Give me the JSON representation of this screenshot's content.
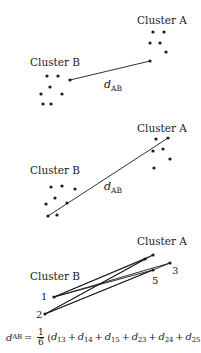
{
  "panels": [
    {
      "id": "single-linkage",
      "cluster_a_label": "Cluster A",
      "cluster_b_label": "Cluster B",
      "distance_label": "d",
      "distance_subscript": "AB",
      "cluster_a_points": [
        [
          153,
          32
        ],
        [
          164,
          32
        ],
        [
          150,
          43
        ],
        [
          160,
          43
        ],
        [
          166,
          52
        ],
        [
          150,
          61
        ]
      ],
      "cluster_b_points": [
        [
          47,
          76
        ],
        [
          58,
          76
        ],
        [
          70,
          80
        ],
        [
          50,
          87
        ],
        [
          41,
          94
        ],
        [
          62,
          94
        ],
        [
          43,
          104
        ],
        [
          51,
          104
        ]
      ],
      "links": [
        [
          [
            70,
            80
          ],
          [
            150,
            61
          ]
        ]
      ]
    },
    {
      "id": "complete-linkage",
      "cluster_a_label": "Cluster A",
      "cluster_b_label": "Cluster B",
      "distance_label": "d",
      "distance_subscript": "AB",
      "cluster_a_points": [
        [
          156,
          139
        ],
        [
          168,
          138
        ],
        [
          153,
          151
        ],
        [
          163,
          149
        ],
        [
          170,
          159
        ],
        [
          154,
          168
        ]
      ],
      "cluster_b_points": [
        [
          51,
          187
        ],
        [
          62,
          186
        ],
        [
          75,
          189
        ],
        [
          55,
          198
        ],
        [
          46,
          204
        ],
        [
          67,
          203
        ],
        [
          48,
          216
        ],
        [
          57,
          215
        ]
      ],
      "links": [
        [
          [
            48,
            216
          ],
          [
            168,
            138
          ]
        ]
      ]
    },
    {
      "id": "average-linkage",
      "cluster_a_label": "Cluster A",
      "cluster_b_label": "Cluster B",
      "cluster_a_points": [
        [
          145,
          259
        ],
        [
          153,
          255
        ],
        [
          170,
          263
        ],
        [
          153,
          270
        ]
      ],
      "cluster_b_points": [
        [
          54,
          297
        ],
        [
          45,
          314
        ]
      ],
      "point_labels": [
        {
          "text": "1",
          "x": 41,
          "y": 300
        },
        {
          "text": "2",
          "x": 36,
          "y": 318
        },
        {
          "text": "3",
          "x": 172,
          "y": 274
        },
        {
          "text": "5",
          "x": 152,
          "y": 284
        }
      ],
      "links": [
        [
          [
            54,
            297
          ],
          [
            145,
            259
          ]
        ],
        [
          [
            54,
            297
          ],
          [
            153,
            255
          ]
        ],
        [
          [
            54,
            297
          ],
          [
            170,
            263
          ]
        ],
        [
          [
            54,
            297
          ],
          [
            153,
            270
          ]
        ],
        [
          [
            45,
            314
          ],
          [
            145,
            259
          ]
        ],
        [
          [
            45,
            314
          ],
          [
            153,
            255
          ]
        ],
        [
          [
            45,
            314
          ],
          [
            170,
            263
          ]
        ],
        [
          [
            45,
            314
          ],
          [
            153,
            270
          ]
        ]
      ]
    }
  ],
  "formula": {
    "lhs": "d",
    "lhs_sub": "AB",
    "equals": "=",
    "frac_num": "1",
    "frac_den": "6",
    "open": "(",
    "terms": [
      {
        "d": "d",
        "sub": "13"
      },
      {
        "d": "d",
        "sub": "14"
      },
      {
        "d": "d",
        "sub": "15"
      },
      {
        "d": "d",
        "sub": "23"
      },
      {
        "d": "d",
        "sub": "24"
      },
      {
        "d": "d",
        "sub": "25"
      },
      {
        "d": "d",
        "sub": "26"
      }
    ],
    "plus": "+",
    "close": ")"
  },
  "colors": {
    "ink": "#1a1a1a",
    "background": "#ffffff"
  }
}
